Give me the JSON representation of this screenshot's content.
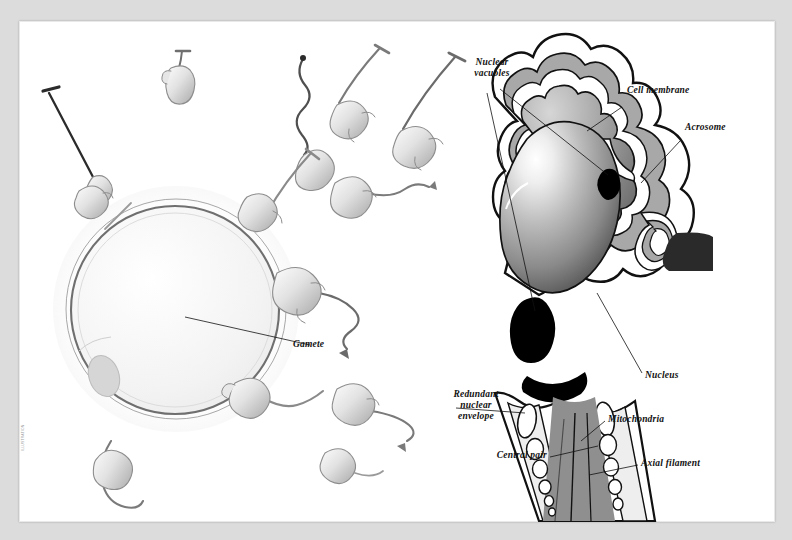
{
  "figure": {
    "style": "grayscale scientific illustration",
    "background_color": "#dcdcdc",
    "page_color": "#ffffff",
    "ink_color": "#111111"
  },
  "panels": {
    "left": {
      "name": "gametes-panel",
      "description": "Ovum surrounded by swimming spermatozoa",
      "ovum": {
        "name": "ovum",
        "fill": "#f2f2f2",
        "outline": "#6f6f6f",
        "nucleus_fill": "#d9d9d9"
      },
      "sperm_count": 13
    },
    "right": {
      "name": "spermatozoon-detail-panel",
      "description": "Cutaway of a single spermatozoon head and midpiece"
    }
  },
  "labels": {
    "gamete": "Gamete",
    "nuclear_vacuoles": "Nuclear\nvacuoles",
    "cell_membrane": "Cell membrane",
    "acrosome": "Acrosome",
    "nucleus": "Nucleus",
    "redundant_nuclear_envelope": "Redundant\nnuclear\nenvelope",
    "mitochondria": "Mitochondria",
    "central_pair": "Central pair",
    "axial_filament": "Axial filament"
  },
  "credit": "ILLUSTRATION"
}
